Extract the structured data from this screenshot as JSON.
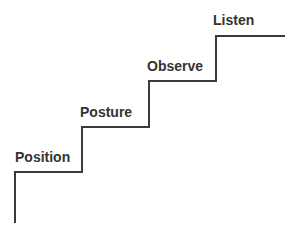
{
  "diagram": {
    "background_color": "#ffffff",
    "line_color": "#3a3a3a",
    "line_width": 2,
    "label_color": "#333333",
    "steps": [
      {
        "id": "position",
        "label": "Position",
        "level": 1,
        "x": 15,
        "y": 149
      },
      {
        "id": "posture",
        "label": "Posture",
        "level": 2,
        "x": 80,
        "y": 104
      },
      {
        "id": "observe",
        "label": "Observe",
        "level": 3,
        "x": 147,
        "y": 58
      },
      {
        "id": "listen",
        "label": "Listen",
        "level": 4,
        "x": 213,
        "y": 12
      }
    ],
    "polyline_points": "15,223 15,172 82,172 82,127 149,127 149,81 216,81 216,36 285,36"
  }
}
